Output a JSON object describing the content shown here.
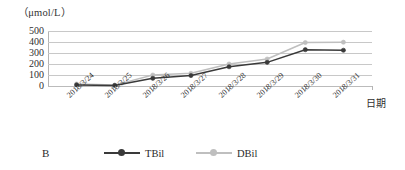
{
  "unit_caption": "（μmol/L）",
  "panel_label": "B",
  "axis": {
    "x_title": "日期",
    "y_ticks": [
      "500",
      "400",
      "300",
      "200",
      "100",
      "0"
    ]
  },
  "legend": {
    "entries": [
      {
        "label": "TBil",
        "color": "#3a3a3a",
        "marker": "circle-filled"
      },
      {
        "label": "DBil",
        "color": "#bfbfbf",
        "marker": "circle-filled"
      }
    ]
  },
  "chart_data": {
    "type": "line",
    "title": "",
    "subtitle": "",
    "xlabel": "日期",
    "ylabel": "（μmol/L）",
    "ylim": [
      0,
      500
    ],
    "y_ticks": [
      0,
      100,
      200,
      300,
      400,
      500
    ],
    "grid": true,
    "legend_position": "bottom",
    "categories": [
      "2018/3/24",
      "2018/3/25",
      "2018/3/26",
      "2018/3/27",
      "2018/3/28",
      "2018/3/29",
      "2018/3/30",
      "2018/3/31"
    ],
    "series": [
      {
        "name": "TBil",
        "color": "#3a3a3a",
        "values": [
          10,
          5,
          70,
          95,
          175,
          215,
          330,
          325
        ]
      },
      {
        "name": "DBil",
        "color": "#bfbfbf",
        "values": [
          18,
          8,
          100,
          115,
          200,
          245,
          395,
          398
        ]
      }
    ]
  }
}
